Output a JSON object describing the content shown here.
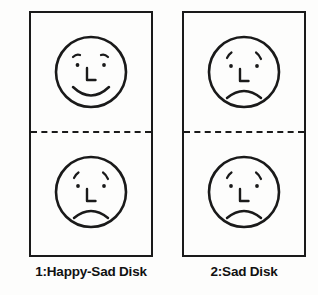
{
  "figure": {
    "title": "",
    "background_color": "#fdfdfc",
    "ink_color": "#1a1a1a",
    "panels": [
      {
        "id": "panel-1",
        "caption": "1:Happy-Sad Disk",
        "divider_style": "dashed",
        "faces": [
          {
            "position": "top",
            "expression": "happy",
            "name": "happy-face",
            "features": [
              "eyebrows",
              "dot-eyes",
              "L-nose",
              "smile-mouth"
            ]
          },
          {
            "position": "bottom",
            "expression": "sad",
            "name": "sad-face",
            "features": [
              "eyebrows",
              "dot-eyes",
              "L-nose",
              "frown-mouth"
            ]
          }
        ]
      },
      {
        "id": "panel-2",
        "caption": "2:Sad Disk",
        "divider_style": "dashed",
        "faces": [
          {
            "position": "top",
            "expression": "sad",
            "name": "sad-face",
            "features": [
              "eyebrows",
              "dot-eyes",
              "L-nose",
              "frown-mouth"
            ]
          },
          {
            "position": "bottom",
            "expression": "sad",
            "name": "sad-face",
            "features": [
              "eyebrows",
              "dot-eyes",
              "L-nose",
              "frown-mouth"
            ]
          }
        ]
      }
    ]
  }
}
